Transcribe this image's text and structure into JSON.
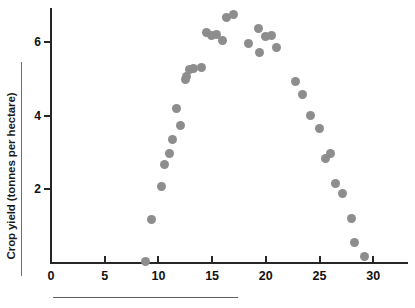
{
  "chart_data": {
    "type": "scatter",
    "title": "",
    "xlabel": "",
    "ylabel": "Crop yield (tonnes per hectare)",
    "xlim": [
      0,
      33.5
    ],
    "ylim": [
      0,
      6.95
    ],
    "xticks": [
      0,
      5,
      10,
      15,
      20,
      25,
      30
    ],
    "xtick_labels": [
      "0",
      "5",
      "10",
      "15",
      "20",
      "25",
      "30"
    ],
    "yticks": [
      2,
      4,
      6
    ],
    "ytick_labels": [
      "2",
      "4",
      "6"
    ],
    "grid": false,
    "legend": null,
    "marker_color": "#8d8d8d",
    "axis_color": "#262626",
    "series": [
      {
        "name": "Crop yield",
        "points": [
          [
            8.8,
            0.05
          ],
          [
            9.4,
            1.17
          ],
          [
            10.3,
            2.08
          ],
          [
            10.6,
            2.68
          ],
          [
            11.0,
            2.98
          ],
          [
            11.3,
            3.35
          ],
          [
            11.7,
            4.19
          ],
          [
            12.1,
            3.74
          ],
          [
            12.5,
            4.99
          ],
          [
            12.6,
            5.08
          ],
          [
            12.9,
            5.25
          ],
          [
            13.3,
            5.29
          ],
          [
            14.0,
            5.31
          ],
          [
            14.5,
            6.27
          ],
          [
            14.9,
            6.19
          ],
          [
            15.4,
            6.2
          ],
          [
            16.0,
            6.05
          ],
          [
            16.3,
            6.67
          ],
          [
            17.0,
            6.76
          ],
          [
            18.4,
            5.96
          ],
          [
            19.3,
            6.36
          ],
          [
            19.4,
            5.73
          ],
          [
            20.0,
            6.15
          ],
          [
            20.5,
            6.18
          ],
          [
            21.0,
            5.85
          ],
          [
            22.8,
            4.93
          ],
          [
            23.4,
            4.58
          ],
          [
            24.2,
            4.01
          ],
          [
            25.0,
            3.65
          ],
          [
            25.6,
            2.85
          ],
          [
            26.0,
            2.98
          ],
          [
            26.5,
            2.16
          ],
          [
            27.1,
            1.9
          ],
          [
            28.0,
            1.22
          ],
          [
            28.3,
            0.55
          ],
          [
            29.2,
            0.18
          ]
        ]
      }
    ]
  },
  "axes": {
    "y_title": "Crop yield (tonnes per hectare)"
  }
}
